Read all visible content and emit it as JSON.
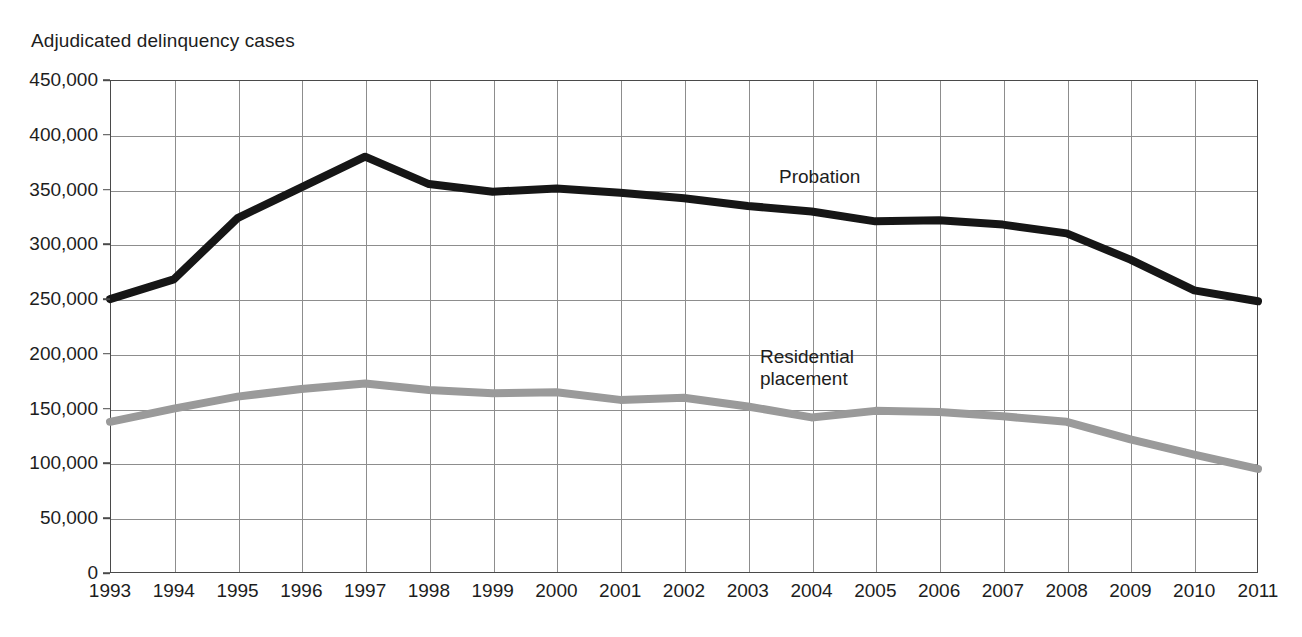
{
  "chart_data": {
    "type": "line",
    "title": "",
    "ylabel": "Adjudicated delinquency cases",
    "xlabel": "",
    "ylim": [
      0,
      450000
    ],
    "ytick_labels": [
      "450,000",
      "400,000",
      "350,000",
      "300,000",
      "250,000",
      "200,000",
      "150,000",
      "100,000",
      "50,000",
      "0"
    ],
    "ytick_values": [
      450000,
      400000,
      350000,
      300000,
      250000,
      200000,
      150000,
      100000,
      50000,
      0
    ],
    "grid": true,
    "legend_position": "inline-annotation",
    "categories": [
      1993,
      1994,
      1995,
      1996,
      1997,
      1998,
      1999,
      2000,
      2001,
      2002,
      2003,
      2004,
      2005,
      2006,
      2007,
      2008,
      2009,
      2010,
      2011
    ],
    "xtick_labels": [
      "1993",
      "1994",
      "1995",
      "1996",
      "1997",
      "1998",
      "1999",
      "2000",
      "2001",
      "2002",
      "2003",
      "2004",
      "2005",
      "2006",
      "2007",
      "2008",
      "2009",
      "2010",
      "2011"
    ],
    "series": [
      {
        "name": "Probation",
        "color": "#161616",
        "values": [
          250000,
          268000,
          324000,
          352000,
          380000,
          355000,
          348000,
          351000,
          347000,
          342000,
          335000,
          330000,
          321000,
          322000,
          318000,
          310000,
          286000,
          258000,
          248000
        ]
      },
      {
        "name": "Residential placement",
        "color": "#9a9a9a",
        "values": [
          138000,
          150000,
          161000,
          168000,
          173000,
          167000,
          164000,
          165000,
          158000,
          160000,
          152000,
          142000,
          148000,
          147000,
          143000,
          138000,
          122000,
          108000,
          95000
        ]
      }
    ],
    "annotations": [
      {
        "text": "Probation",
        "series": "Probation"
      },
      {
        "text": "Residential\nplacement",
        "series": "Residential placement"
      }
    ]
  },
  "caption": {
    "source_text": ""
  }
}
